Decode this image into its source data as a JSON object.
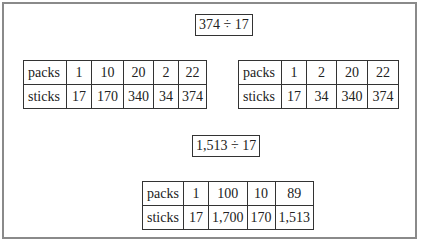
{
  "problem1": {
    "expression": "374 ÷ 17",
    "table_left": {
      "row_labels": [
        "packs",
        "sticks"
      ],
      "packs": [
        "1",
        "10",
        "20",
        "2",
        "22"
      ],
      "sticks": [
        "17",
        "170",
        "340",
        "34",
        "374"
      ]
    },
    "table_right": {
      "row_labels": [
        "packs",
        "sticks"
      ],
      "packs": [
        "1",
        "2",
        "20",
        "22"
      ],
      "sticks": [
        "17",
        "34",
        "340",
        "374"
      ]
    }
  },
  "problem2": {
    "expression": "1,513 ÷ 17",
    "table": {
      "row_labels": [
        "packs",
        "sticks"
      ],
      "packs": [
        "1",
        "100",
        "10",
        "89"
      ],
      "sticks": [
        "17",
        "1,700",
        "170",
        "1,513"
      ]
    }
  }
}
